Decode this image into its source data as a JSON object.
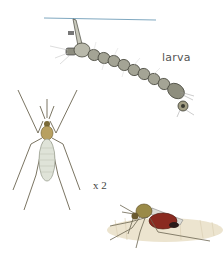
{
  "illustration": {
    "subject": "mosquito life stages",
    "labels": {
      "larva": "larva",
      "scale": "x 2"
    },
    "figures": [
      {
        "name": "larva",
        "description": "segmented mosquito larva hanging from water surface by breathing siphon"
      },
      {
        "name": "adult-mosquito-dorsal",
        "description": "adult mosquito, top view, pale abdomen"
      },
      {
        "name": "adult-mosquito-feeding",
        "description": "adult mosquito feeding on skin, red blood-filled abdomen"
      }
    ],
    "colors": {
      "water_line": "#7fa8c0",
      "larva_body": "#9a9a88",
      "larva_outline": "#4a4a40",
      "adult_thorax": "#b8a060",
      "adult_abdomen": "#dfe3d8",
      "blood_abdomen": "#8a2a20",
      "skin": "#e8dfc8",
      "text": "#555555"
    }
  }
}
